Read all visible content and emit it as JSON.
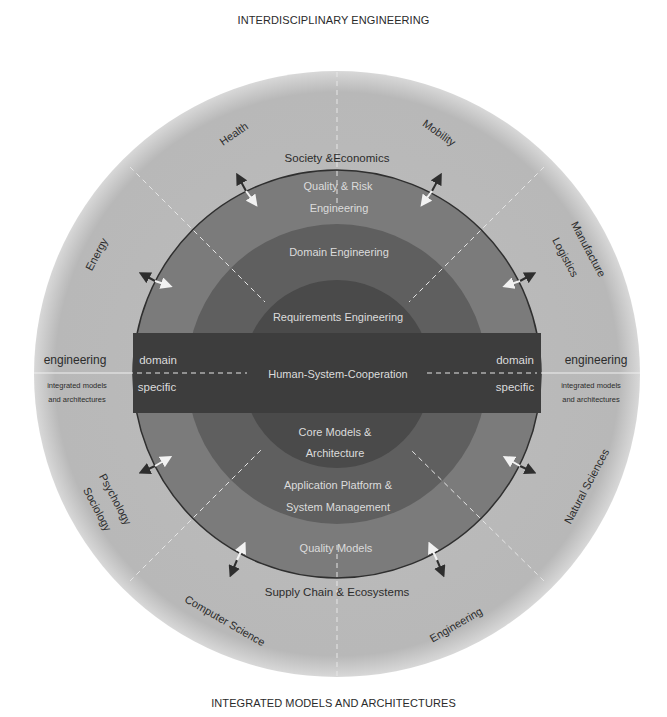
{
  "titles": {
    "top": "INTERDISCIPLINARY ENGINEERING",
    "bottom": "INTEGRATED MODELS AND ARCHITECTURES"
  },
  "outer_ring": {
    "sectors": {
      "health": "Health",
      "mobility": "Mobility",
      "energy": "Energy",
      "manufacture": "Manufacture",
      "logistics": "Logistics",
      "psychology": "Psychology",
      "sociology": "Sociology",
      "natural_sciences": "Natural Sciences",
      "computer_science": "Computer Science",
      "engineering": "Engineering"
    },
    "top_label": "Society &Economics",
    "bottom_label": "Supply Chain & Ecosystems",
    "left": {
      "heading": "engineering",
      "sub1": "integrated models",
      "sub2": "and architectures"
    },
    "right": {
      "heading": "engineering",
      "sub1": "integrated models",
      "sub2": "and architectures"
    }
  },
  "layers": {
    "quality_risk_line1": "Quality & Risk",
    "quality_risk_line2": "Engineering",
    "domain_engineering": "Domain Engineering",
    "requirements_engineering": "Requirements Engineering",
    "human_system_cooperation": "Human-System-Cooperation",
    "core_models_line1": "Core Models &",
    "core_models_line2": "Architecture",
    "app_platform_line1": "Application Platform &",
    "app_platform_line2": "System Management",
    "quality_models": "Quality Models"
  },
  "band": {
    "left_line1": "domain",
    "left_line2": "specific",
    "right_line1": "domain",
    "right_line2": "specific"
  },
  "colors": {
    "outer_light": "#b9b9b9",
    "ring_quality": "#7b7b7b",
    "ring_domain": "#5f5f5f",
    "core": "#484848",
    "band": "#3d3d3d",
    "label_dark": "#2c2c2c",
    "label_light": "#dcdcdc"
  }
}
